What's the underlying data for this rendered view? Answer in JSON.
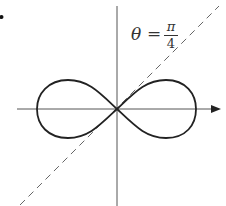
{
  "figure": {
    "label": {
      "lhs": "θ",
      "eq": "=",
      "numerator": "π",
      "denominator": "4"
    },
    "curve": "lemniscate",
    "line_style": "dashed",
    "colors": {
      "stroke": "#222222",
      "axis": "#444444",
      "dashed": "#666666"
    }
  }
}
